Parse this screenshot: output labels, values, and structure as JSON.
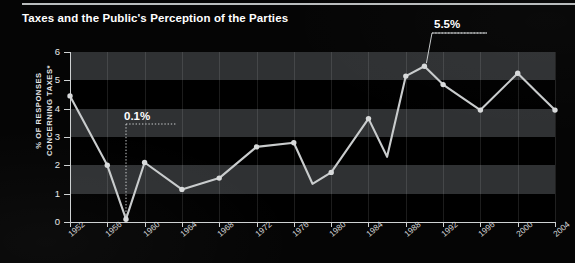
{
  "title": "Taxes and the Public's Perception of the Parties",
  "colors": {
    "background": "#050505",
    "plot_background": "#000000",
    "band": "#2f3133",
    "line": "#c9cccd",
    "marker": "#d8dadb",
    "axis": "#cfd2d3",
    "text": "#ffffff",
    "tick_text": "#e3e5e6"
  },
  "annotations": [
    {
      "name": "low-point-callout",
      "text": "0.1%",
      "x": 1958,
      "y": 0.1
    },
    {
      "name": "high-point-callout",
      "text": "5.5%",
      "x": 1990,
      "y": 5.5
    }
  ],
  "chart_data": {
    "type": "line",
    "title": "Taxes and the Public's Perception of the Parties",
    "xlabel": "",
    "ylabel": "% OF RESPONSES CONCERNING TAXES*",
    "ylabel_lines": [
      "% OF RESPONSES",
      "CONCERNING TAXES*"
    ],
    "xlim": [
      1952,
      2004
    ],
    "ylim": [
      0,
      6
    ],
    "yticks": [
      0,
      1,
      2,
      3,
      4,
      5,
      6
    ],
    "ytick_labels": [
      "0",
      "1",
      "2",
      "3",
      "4",
      "5",
      "6"
    ],
    "xticks": [
      1952,
      1956,
      1960,
      1964,
      1968,
      1972,
      1976,
      1980,
      1984,
      1988,
      1992,
      1996,
      2000,
      2004
    ],
    "xtick_labels": [
      "1952",
      "1956",
      "1960",
      "1964",
      "1968",
      "1972",
      "1976",
      "1980",
      "1984",
      "1988",
      "1992",
      "1996",
      "2000",
      "2004"
    ],
    "grid": "horizontal-bands",
    "legend": "none",
    "series": [
      {
        "name": "% of responses concerning taxes",
        "x": [
          1952,
          1956,
          1958,
          1960,
          1964,
          1968,
          1972,
          1976,
          1978,
          1980,
          1984,
          1986,
          1988,
          1990,
          1992,
          1994,
          1996,
          2000,
          2002,
          2004
        ],
        "values": [
          4.45,
          2.0,
          0.1,
          2.1,
          1.15,
          1.55,
          2.65,
          2.8,
          1.35,
          1.75,
          3.65,
          2.3,
          5.15,
          5.5,
          4.85,
          4.4,
          3.95,
          5.25,
          4.6,
          3.95
        ]
      }
    ]
  }
}
